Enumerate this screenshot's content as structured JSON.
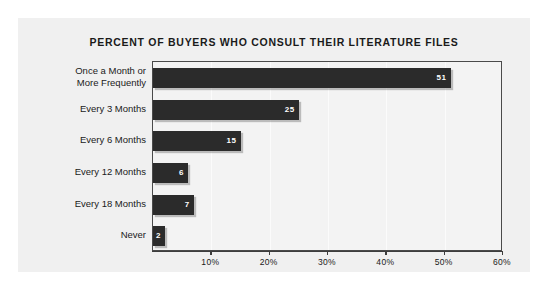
{
  "chart_data": {
    "type": "bar",
    "orientation": "horizontal",
    "title": "PERCENT OF BUYERS WHO CONSULT THEIR LITERATURE FILES",
    "xlabel": "",
    "ylabel": "",
    "categories": [
      "Once a Month or More Frequently",
      "Every 3 Months",
      "Every 6 Months",
      "Every 12 Months",
      "Every 18 Months",
      "Never"
    ],
    "category_lines": [
      [
        "Once a Month or",
        "More Frequently"
      ],
      [
        "Every 3 Months"
      ],
      [
        "Every 6 Months"
      ],
      [
        "Every 12 Months"
      ],
      [
        "Every 18 Months"
      ],
      [
        "Never"
      ]
    ],
    "values": [
      51,
      25,
      15,
      6,
      7,
      2
    ],
    "value_labels": [
      "51",
      "25",
      "15",
      "6",
      "7",
      "2"
    ],
    "xlim": [
      0,
      60
    ],
    "xticks": [
      0,
      10,
      20,
      30,
      40,
      50,
      60
    ],
    "xtick_labels": [
      "",
      "10%",
      "20%",
      "30%",
      "40%",
      "50%",
      "60%"
    ],
    "grid": true,
    "legend": null,
    "bar_color": "#2b2b2b",
    "value_label_color": "#ffffff",
    "plot_background": "#f3f3f3",
    "figure_background": "#f0f0f0",
    "axis_color": "#4a4a4a"
  }
}
